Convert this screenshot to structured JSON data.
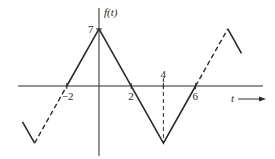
{
  "chart_data": {
    "type": "line",
    "title": "",
    "ylabel": "f(t)",
    "xlabel": "t",
    "xlim": [
      -6.2,
      11
    ],
    "ylim": [
      -9,
      10
    ],
    "grid": false,
    "x_tick_labels": [
      {
        "t": -2,
        "label": "−2"
      },
      {
        "t": 2,
        "label": "2"
      },
      {
        "t": 4,
        "label": "4"
      },
      {
        "t": 6,
        "label": "6"
      }
    ],
    "y_tick_labels": [
      {
        "f": 7,
        "label": "7"
      }
    ],
    "series": [
      {
        "name": "f(t) shown period (solid)",
        "style": "solid",
        "points": [
          [
            0,
            7
          ],
          [
            4,
            -7
          ],
          [
            6,
            0
          ]
        ]
      },
      {
        "name": "f(t) left rise into period (solid)",
        "style": "solid",
        "points": [
          [
            -2,
            0
          ],
          [
            0,
            7
          ]
        ]
      },
      {
        "name": "periodic extension left (dashed)",
        "style": "dashed",
        "points": [
          [
            -4,
            -7
          ],
          [
            -2,
            0
          ]
        ]
      },
      {
        "name": "periodic extension left tail (solid)",
        "style": "solid",
        "points": [
          [
            -4.75,
            -4.4
          ],
          [
            -4,
            -7
          ]
        ]
      },
      {
        "name": "periodic extension right (dashed)",
        "style": "dashed",
        "points": [
          [
            6,
            0
          ],
          [
            8,
            7
          ]
        ]
      },
      {
        "name": "periodic extension right tail (solid)",
        "style": "solid",
        "points": [
          [
            8,
            7
          ],
          [
            8.85,
            4
          ]
        ]
      }
    ],
    "guides": [
      {
        "name": "t=4 dashed drop line",
        "from": [
          4,
          0
        ],
        "to": [
          4,
          -7
        ]
      }
    ],
    "annotations": [
      "t → arrow on horizontal axis"
    ]
  }
}
